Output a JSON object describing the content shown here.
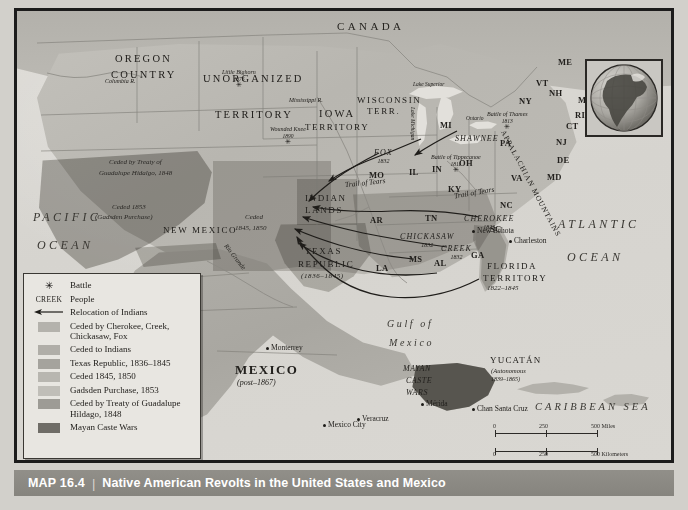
{
  "caption": {
    "number": "MAP 16.4",
    "separator": "|",
    "title": "Native American Revolts in the United States and Mexico"
  },
  "legend": {
    "items": [
      {
        "key": "star",
        "label": "Battle"
      },
      {
        "key": "creek",
        "key_text": "CREEK",
        "label": "People"
      },
      {
        "key": "arrow",
        "label": "Relocation of Indians"
      },
      {
        "key": "swatch",
        "color": "#b4b2ac",
        "label": "Ceded by Cherokee, Creek, Chickasaw, Fox"
      },
      {
        "key": "swatch",
        "color": "#b0aea8",
        "label": "Ceded to Indians"
      },
      {
        "key": "swatch",
        "color": "#a5a39d",
        "label": "Texas Republic, 1836–1845"
      },
      {
        "key": "swatch",
        "color": "#b8b6b0",
        "label": "Ceded 1845, 1850"
      },
      {
        "key": "swatch",
        "color": "#c0beb8",
        "label": "Gadsden Purchase, 1853"
      },
      {
        "key": "swatch",
        "color": "#9d9b95",
        "label": "Ceded by Treaty of Guadalupe Hildago, 1848"
      },
      {
        "key": "swatch",
        "color": "#6f6d67",
        "label": "Mayan Caste Wars"
      }
    ]
  },
  "oceans": {
    "pacific_line1": "PACIFIC",
    "pacific_line2": "OCEAN",
    "atlantic_line1": "ATLANTIC",
    "atlantic_line2": "OCEAN",
    "caribbean": "CARIBBEAN SEA",
    "gulf_line1": "Gulf of",
    "gulf_line2": "Mexico"
  },
  "countries": {
    "canada": "CANADA",
    "mexico": "MEXICO",
    "mexico_date": "(post–1867)"
  },
  "territories": {
    "oregon_line1": "OREGON",
    "oregon_line2": "COUNTRY",
    "unorganized_line1": "UNORGANIZED",
    "unorganized_line2": "TERRITORY",
    "iowa_line1": "IOWA",
    "iowa_line2": "TERRITORY",
    "wisconsin_line1": "WISCONSIN",
    "wisconsin_line2": "TERR.",
    "indian_line1": "INDIAN",
    "indian_line2": "LANDS",
    "new_mexico": "NEW MEXICO",
    "texas_line1": "TEXAS",
    "texas_line2": "REPUBLIC",
    "texas_date": "(1836–1845)",
    "florida_line1": "FLORIDA",
    "florida_line2": "TERRITORY",
    "florida_date": "1822–1845",
    "yucatan": "YUCATÁN",
    "yucatan_status": "(Autonomous",
    "yucatan_date": "1839–1865)"
  },
  "cessions": {
    "guadalupe_line1": "Ceded by Treaty of",
    "guadalupe_line2": "Guadalupe Hidalgo, 1848",
    "gadsden_line1": "Ceded 1853",
    "gadsden_line2": "(Gadsden Purchase)",
    "ceded4550_line1": "Ceded",
    "ceded4550_line2": "1845, 1850"
  },
  "states": [
    {
      "label": "ME",
      "x": 541,
      "y": 47
    },
    {
      "label": "VT",
      "x": 519,
      "y": 68
    },
    {
      "label": "NH",
      "x": 532,
      "y": 78
    },
    {
      "label": "MA",
      "x": 561,
      "y": 85
    },
    {
      "label": "RI",
      "x": 558,
      "y": 100
    },
    {
      "label": "CT",
      "x": 549,
      "y": 111
    },
    {
      "label": "NY",
      "x": 502,
      "y": 86
    },
    {
      "label": "NJ",
      "x": 539,
      "y": 127
    },
    {
      "label": "PA",
      "x": 483,
      "y": 128
    },
    {
      "label": "DE",
      "x": 540,
      "y": 145
    },
    {
      "label": "MD",
      "x": 530,
      "y": 162
    },
    {
      "label": "VA",
      "x": 494,
      "y": 163
    },
    {
      "label": "NC",
      "x": 483,
      "y": 190
    },
    {
      "label": "SC",
      "x": 473,
      "y": 214
    },
    {
      "label": "GA",
      "x": 454,
      "y": 240
    },
    {
      "label": "MI",
      "x": 423,
      "y": 110
    },
    {
      "label": "IN",
      "x": 415,
      "y": 154
    },
    {
      "label": "OH",
      "x": 442,
      "y": 148
    },
    {
      "label": "IL",
      "x": 392,
      "y": 157
    },
    {
      "label": "MO",
      "x": 352,
      "y": 160
    },
    {
      "label": "KY",
      "x": 431,
      "y": 174
    },
    {
      "label": "TN",
      "x": 408,
      "y": 203
    },
    {
      "label": "AR",
      "x": 353,
      "y": 205
    },
    {
      "label": "MS",
      "x": 392,
      "y": 244
    },
    {
      "label": "AL",
      "x": 417,
      "y": 248
    },
    {
      "label": "LA",
      "x": 359,
      "y": 253
    }
  ],
  "tribes": [
    {
      "label": "FOX",
      "date": "1832",
      "x": 357,
      "y": 138
    },
    {
      "label": "CHICKASAW",
      "date": "1832",
      "x": 383,
      "y": 222
    },
    {
      "label": "CREEK",
      "date": "1832",
      "x": 424,
      "y": 234
    },
    {
      "label": "CHEROKEE",
      "date": "1823",
      "x": 447,
      "y": 204
    },
    {
      "label": "SHAWNEE",
      "date": "",
      "x": 438,
      "y": 124
    }
  ],
  "battles": [
    {
      "label": "Little Bighorn",
      "date": "1876",
      "x": 205,
      "y": 58
    },
    {
      "label": "Wounded Knee",
      "date": "1890",
      "x": 253,
      "y": 115
    },
    {
      "label": "Battle of Thames",
      "date": "1813",
      "x": 470,
      "y": 100
    },
    {
      "label": "Battle of Tippecanoe",
      "date": "1811",
      "x": 414,
      "y": 143
    }
  ],
  "cities": [
    {
      "label": "Charleston",
      "x": 492,
      "y": 226
    },
    {
      "label": "New Echota",
      "x": 455,
      "y": 216
    },
    {
      "label": "Monterrey",
      "x": 249,
      "y": 333
    },
    {
      "label": "Mexico City",
      "x": 306,
      "y": 410
    },
    {
      "label": "Veracruz",
      "x": 340,
      "y": 404
    },
    {
      "label": "Mérida",
      "x": 404,
      "y": 389
    },
    {
      "label": "Chan Santa Cruz",
      "x": 455,
      "y": 394
    }
  ],
  "features": {
    "mayan_caste_wars_line1": "MAYAN",
    "mayan_caste_wars_line2": "CASTE",
    "mayan_caste_wars_line3": "WARS",
    "trail_of_tears": "Trail of Tears",
    "appalachian": "APPALACHIAN MOUNTAINS",
    "columbia_river": "Columbia R.",
    "mississippi_river": "Mississippi R.",
    "rio_grande": "Rio Grande",
    "lake_michigan": "Lake Michigan",
    "lake_superior": "Lake Superior",
    "lake_ontario": "Ontario"
  },
  "scale": {
    "miles": {
      "t0": "0",
      "t1": "250",
      "t2": "500 Miles"
    },
    "km": {
      "t0": "0",
      "t1": "250",
      "t2": "500 Kilometers"
    }
  }
}
